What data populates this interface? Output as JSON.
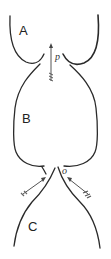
{
  "diagram": {
    "chambers": [
      {
        "id": "A",
        "label": "A"
      },
      {
        "id": "B",
        "label": "B"
      },
      {
        "id": "C",
        "label": "C"
      }
    ],
    "arrows": [
      {
        "id": "p",
        "label": "p",
        "direction": "up"
      },
      {
        "id": "o",
        "label": "o",
        "direction": "inward-converging"
      }
    ],
    "colors": {
      "line": "#2a2a2a",
      "background": "#ffffff"
    }
  }
}
